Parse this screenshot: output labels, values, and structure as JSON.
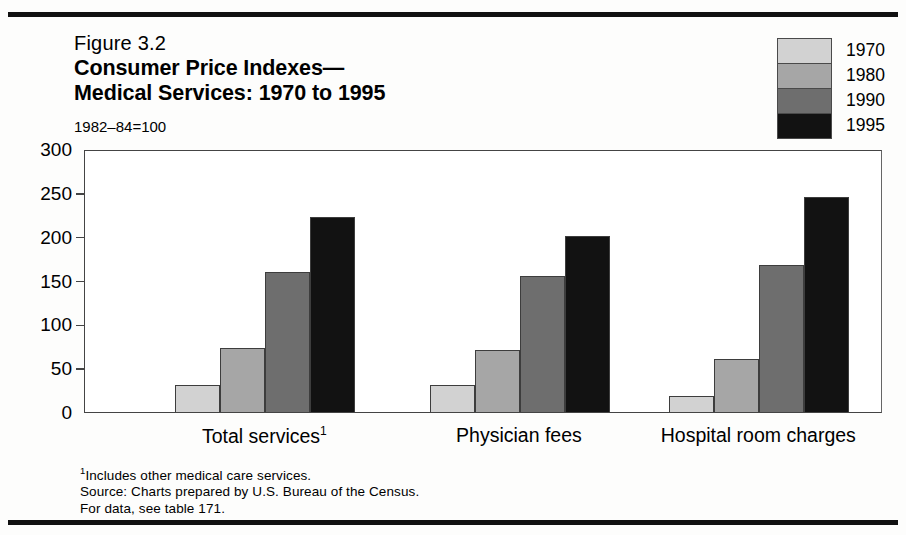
{
  "figure_number": "Figure 3.2",
  "title_line1": "Consumer Price Indexes—",
  "title_line2": "Medical Services:  1970 to 1995",
  "subtitle": "1982–84=100",
  "legend": {
    "items": [
      {
        "label": "1970",
        "color": "#d2d2d2"
      },
      {
        "label": "1980",
        "color": "#a6a6a6"
      },
      {
        "label": "1990",
        "color": "#6e6e6e"
      },
      {
        "label": "1995",
        "color": "#121212"
      }
    ]
  },
  "notes": {
    "footnote": "Includes other medical care services.",
    "footnote_marker": "1",
    "source": "Source:  Charts prepared by U.S. Bureau of the Census.",
    "reference": "For  data, see table 171."
  },
  "chart_data": {
    "type": "bar",
    "subtitle": "1982–84=100",
    "xlabel": "",
    "ylabel": "",
    "ylim": [
      0,
      300
    ],
    "yticks": [
      0,
      50,
      100,
      150,
      200,
      250,
      300
    ],
    "grid": false,
    "legend_position": "top-right",
    "categories": [
      "Total services",
      "Physician fees",
      "Hospital room charges"
    ],
    "category_labels": [
      "Total services¹",
      "Physician fees",
      "Hospital room charges"
    ],
    "series": [
      {
        "name": "1970",
        "color": "#d2d2d2",
        "values": [
          31,
          31,
          18
        ]
      },
      {
        "name": "1980",
        "color": "#a6a6a6",
        "values": [
          73,
          71,
          61
        ]
      },
      {
        "name": "1990",
        "color": "#6e6e6e",
        "values": [
          160,
          155,
          168
        ]
      },
      {
        "name": "1995",
        "color": "#121212",
        "values": [
          222,
          201,
          245
        ]
      }
    ]
  }
}
